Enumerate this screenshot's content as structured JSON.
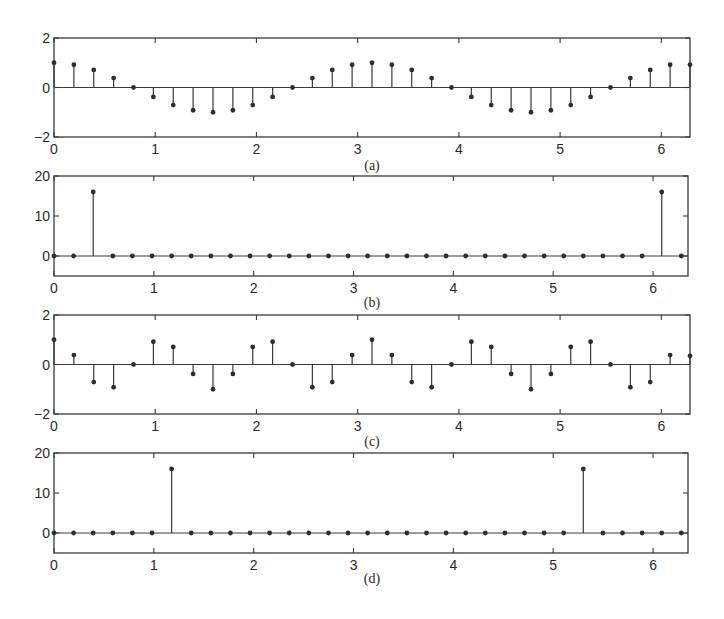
{
  "chart_data": [
    {
      "id": "a",
      "type": "stem",
      "caption": "(a)",
      "xlim": [
        0,
        6.2832
      ],
      "ylim": [
        -2,
        2
      ],
      "xticks": [
        0,
        1,
        2,
        3,
        4,
        5,
        6
      ],
      "yticks": [
        -2,
        0,
        2
      ],
      "grid": false,
      "x_step": 0.19635,
      "values": [
        1.0,
        0.92,
        0.71,
        0.38,
        0.0,
        -0.38,
        -0.71,
        -0.92,
        -1.0,
        -0.92,
        -0.71,
        -0.38,
        0.0,
        0.38,
        0.71,
        0.92,
        1.0,
        0.92,
        0.71,
        0.38,
        0.0,
        -0.38,
        -0.71,
        -0.92,
        -1.0,
        -0.92,
        -0.71,
        -0.38,
        0.0,
        0.38,
        0.71,
        0.92
      ],
      "extra_last_point": {
        "x": 6.2832,
        "y": 0.92
      },
      "frame": {
        "left": 54,
        "right": 690,
        "top": 38,
        "bottom": 137
      }
    },
    {
      "id": "b",
      "type": "stem",
      "caption": "(b)",
      "xlim": [
        0,
        6.35
      ],
      "ylim": [
        -5,
        20
      ],
      "xticks": [
        0,
        1,
        2,
        3,
        4,
        5,
        6
      ],
      "yticks": [
        0,
        10,
        20
      ],
      "grid": false,
      "x_step": 0.19635,
      "values": [
        0,
        0,
        16,
        0,
        0,
        0,
        0,
        0,
        0,
        0,
        0,
        0,
        0,
        0,
        0,
        0,
        0,
        0,
        0,
        0,
        0,
        0,
        0,
        0,
        0,
        0,
        0,
        0,
        0,
        0,
        0,
        16,
        0
      ],
      "frame": {
        "left": 54,
        "right": 688,
        "top": 176,
        "bottom": 276
      }
    },
    {
      "id": "c",
      "type": "stem",
      "caption": "(c)",
      "xlim": [
        0,
        6.2832
      ],
      "ylim": [
        -2,
        2
      ],
      "xticks": [
        0,
        1,
        2,
        3,
        4,
        5,
        6
      ],
      "yticks": [
        -2,
        0,
        2
      ],
      "grid": false,
      "x_step": 0.19635,
      "values": [
        1.0,
        0.38,
        -0.71,
        -0.92,
        0.0,
        0.92,
        0.71,
        -0.38,
        -1.0,
        -0.38,
        0.71,
        0.92,
        0.0,
        -0.92,
        -0.71,
        0.38,
        1.0,
        0.38,
        -0.71,
        -0.92,
        0.0,
        0.92,
        0.71,
        -0.38,
        -1.0,
        -0.38,
        0.71,
        0.92,
        0.0,
        -0.92,
        -0.71,
        0.38
      ],
      "extra_last_point": {
        "x": 6.2832,
        "y": 0.35
      },
      "frame": {
        "left": 54,
        "right": 690,
        "top": 315,
        "bottom": 414
      }
    },
    {
      "id": "d",
      "type": "stem",
      "caption": "(d)",
      "xlim": [
        0,
        6.35
      ],
      "ylim": [
        -5,
        20
      ],
      "xticks": [
        0,
        1,
        2,
        3,
        4,
        5,
        6
      ],
      "yticks": [
        0,
        10,
        20
      ],
      "grid": false,
      "x_step": 0.19635,
      "values": [
        0,
        0,
        0,
        0,
        0,
        0,
        16,
        0,
        0,
        0,
        0,
        0,
        0,
        0,
        0,
        0,
        0,
        0,
        0,
        0,
        0,
        0,
        0,
        0,
        0,
        0,
        0,
        16,
        0,
        0,
        0,
        0,
        0
      ],
      "frame": {
        "left": 54,
        "right": 688,
        "top": 453,
        "bottom": 553
      }
    }
  ],
  "labels": {
    "a": "(a)",
    "b": "(b)",
    "c": "(c)",
    "d": "(d)"
  }
}
